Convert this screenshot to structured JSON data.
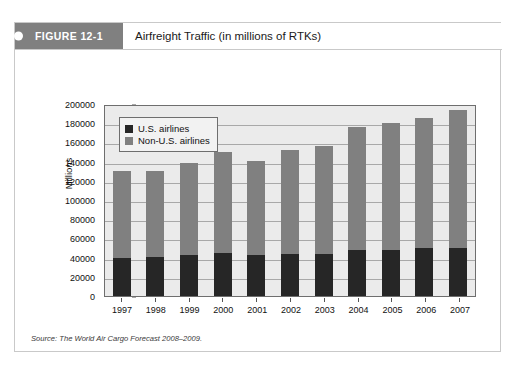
{
  "figure": {
    "tab_label": "FIGURE 12-1",
    "title": "Airfreight Traffic (in millions of RTKs)",
    "source_note": "Source: The World Air Cargo Forecast 2008–2009."
  },
  "legend": {
    "position": "top-left-inside",
    "entries": [
      {
        "label": "U.S. airlines",
        "color": "#262626"
      },
      {
        "label": "Non-U.S. airlines",
        "color": "#808080"
      }
    ]
  },
  "colors": {
    "us_airlines": "#262626",
    "non_us_airlines": "#808080",
    "plot_background": "#ebebeb",
    "gridline": "#a8a8a8",
    "tab_background": "#808080",
    "card_border": "#c9c9c9"
  },
  "chart_data": {
    "type": "bar",
    "subtype": "stacked-column",
    "title": "Airfreight Traffic (in millions of RTKs)",
    "xlabel": "",
    "ylabel": "Millions",
    "ylim": [
      0,
      200000
    ],
    "ytick_step": 20000,
    "yticks": [
      "200000",
      "180000",
      "160000",
      "140000",
      "120000",
      "100000",
      "80000",
      "60000",
      "40000",
      "20000",
      "0"
    ],
    "grid": true,
    "categories": [
      "1997",
      "1998",
      "1999",
      "2000",
      "2001",
      "2002",
      "2003",
      "2004",
      "2005",
      "2006",
      "2007"
    ],
    "series": [
      {
        "name": "U.S. airlines",
        "color": "#262626",
        "values": [
          40000,
          41000,
          43000,
          45000,
          42500,
          44000,
          44000,
          48000,
          48000,
          50000,
          50000
        ]
      },
      {
        "name": "Non-U.S. airlines",
        "color": "#808080",
        "values": [
          90000,
          89000,
          96000,
          105000,
          98500,
          108000,
          112000,
          128000,
          132000,
          135000,
          144000
        ]
      }
    ],
    "totals": [
      130000,
      130000,
      139000,
      150000,
      141000,
      152000,
      156000,
      176000,
      180000,
      185000,
      194000
    ]
  }
}
